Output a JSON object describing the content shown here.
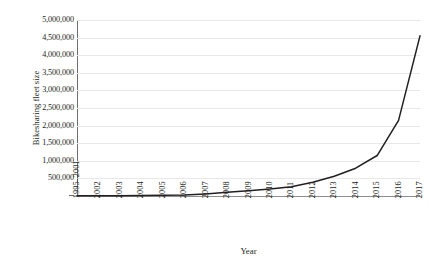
{
  "chart_data": {
    "type": "line",
    "title": "",
    "xlabel": "Year",
    "ylabel": "Bikesharing fleet size",
    "categories": [
      "1995–2001",
      "2002",
      "2003",
      "2004",
      "2005",
      "2006",
      "2007",
      "2008",
      "2009",
      "2010",
      "2011",
      "2012",
      "2013",
      "2014",
      "2015",
      "2016",
      "2017"
    ],
    "values": [
      4000,
      6000,
      9000,
      13000,
      18000,
      26000,
      60000,
      105000,
      150000,
      200000,
      260000,
      390000,
      560000,
      790000,
      1150000,
      2150000,
      4550000
    ],
    "series": [
      {
        "name": "Bikesharing fleet size",
        "values": [
          4000,
          6000,
          9000,
          13000,
          18000,
          26000,
          60000,
          105000,
          150000,
          200000,
          260000,
          390000,
          560000,
          790000,
          1150000,
          2150000,
          4550000
        ]
      }
    ],
    "ylim": [
      0,
      5000000
    ],
    "ytick_step": 500000,
    "ytick_labels": [
      "-",
      "500,000",
      "1,000,000",
      "1,500,000",
      "2,000,000",
      "2,500,000",
      "3,000,000",
      "3,500,000",
      "4,000,000",
      "4,500,000",
      "5,000,000"
    ],
    "ytick_values": [
      0,
      500000,
      1000000,
      1500000,
      2000000,
      2500000,
      3000000,
      3500000,
      4000000,
      4500000,
      5000000
    ],
    "grid": true,
    "grid_axis": "y",
    "legend": false,
    "legend_position": "none",
    "line_color": "#231f20",
    "grid_color": "#e8e8e8",
    "axis_color": "#6f6f6f",
    "background_color": "#ffffff",
    "xtick_rotation": -90
  }
}
